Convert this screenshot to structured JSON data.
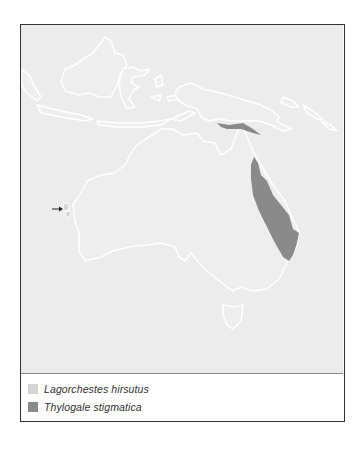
{
  "map": {
    "region": "Australia, New Guinea and Indonesia",
    "colors": {
      "sea": "#ececec",
      "land": "#f2f2f2",
      "coast": "#ffffff",
      "range_lagorchestes": "#d4d4d4",
      "range_thylogale": "#8a8a8a"
    },
    "annotations": {
      "arrow": "arrow pointing to small islands off Western Australia (Lagorchestes hirsutus range)"
    }
  },
  "legend": {
    "items": [
      {
        "label": "Lagorchestes hirsutus",
        "color": "#d4d4d4"
      },
      {
        "label": "Thylogale stigmatica",
        "color": "#8a8a8a"
      }
    ]
  }
}
